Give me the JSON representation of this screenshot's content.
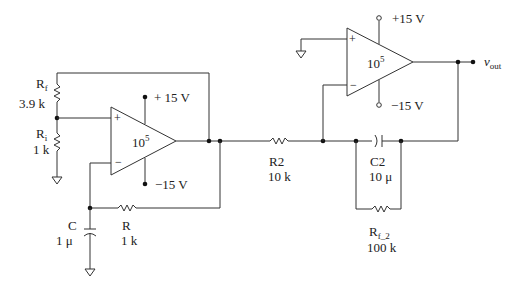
{
  "diagram": {
    "type": "circuit-schematic",
    "stage1": {
      "opamp": {
        "gain_base": "10",
        "gain_exp": "5",
        "plus_sign": "+",
        "minus_sign": "−",
        "supply_pos": "+ 15 V",
        "supply_neg": "−15 V"
      },
      "rf": {
        "name": "R",
        "sub": "f",
        "value": "3.9 k"
      },
      "ri": {
        "name": "R",
        "sub": "i",
        "value": "1 k"
      },
      "c": {
        "name": "C",
        "value": "1  μ"
      },
      "r": {
        "name": "R",
        "value": "1 k"
      }
    },
    "stage2": {
      "opamp": {
        "gain_base": "10",
        "gain_exp": "5",
        "plus_sign": "+",
        "minus_sign": "−",
        "supply_pos": "+15 V",
        "supply_neg": "−15  V"
      },
      "r2": {
        "name": "R2",
        "value": "10 k"
      },
      "c2": {
        "name": "C2",
        "value": "10 μ"
      },
      "rf2": {
        "name": "R",
        "sub": "f_2",
        "value": "100 k"
      }
    },
    "output": {
      "name": "v",
      "sub": "out"
    }
  }
}
